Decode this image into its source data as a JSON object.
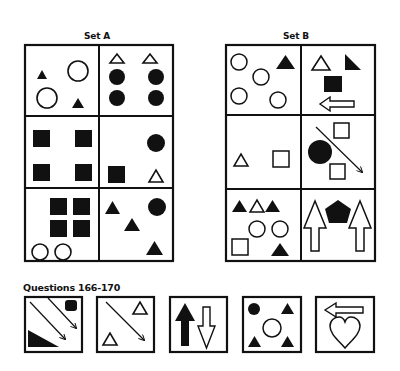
{
  "set_a": {
    "title": "Set A",
    "cells": [
      {
        "row": 1,
        "col": 1,
        "shapes": [
          "black triangle",
          "white circle",
          "white circle",
          "black triangle"
        ]
      },
      {
        "row": 1,
        "col": 2,
        "shapes": [
          "white triangle",
          "white triangle",
          "black circle",
          "black circle",
          "black circle",
          "black circle"
        ]
      },
      {
        "row": 2,
        "col": 1,
        "shapes": [
          "black square",
          "black square",
          "black square",
          "black square"
        ]
      },
      {
        "row": 2,
        "col": 2,
        "shapes": [
          "black circle",
          "black square",
          "white triangle"
        ]
      },
      {
        "row": 3,
        "col": 1,
        "shapes": [
          "black square",
          "black square",
          "black square",
          "black square",
          "white circle",
          "white circle"
        ]
      },
      {
        "row": 3,
        "col": 2,
        "shapes": [
          "black triangle",
          "black circle",
          "black triangle",
          "black triangle"
        ]
      }
    ]
  },
  "set_b": {
    "title": "Set B",
    "cells": [
      {
        "row": 1,
        "col": 1,
        "shapes": [
          "white circle",
          "black triangle",
          "white circle",
          "white circle",
          "white circle"
        ]
      },
      {
        "row": 1,
        "col": 2,
        "shapes": [
          "white triangle",
          "black right triangle",
          "black square",
          "white left arrow"
        ]
      },
      {
        "row": 2,
        "col": 1,
        "shapes": [
          "white triangle",
          "white square"
        ]
      },
      {
        "row": 2,
        "col": 2,
        "shapes": [
          "white square",
          "black circle",
          "white square",
          "diagonal arrow"
        ]
      },
      {
        "row": 3,
        "col": 1,
        "shapes": [
          "black triangle",
          "white triangle",
          "black triangle",
          "white circle",
          "white circle",
          "white square",
          "black triangle"
        ]
      },
      {
        "row": 3,
        "col": 2,
        "shapes": [
          "white up arrow",
          "black pentagon",
          "white up arrow"
        ]
      }
    ]
  },
  "questions": {
    "title": "Questions 166-170",
    "items": [
      {
        "number": 166,
        "shapes": [
          "diagonal arrow",
          "diagonal arrow",
          "black rounded square",
          "black right triangle"
        ]
      },
      {
        "number": 167,
        "shapes": [
          "diagonal arrow",
          "white triangle",
          "white triangle"
        ]
      },
      {
        "number": 168,
        "shapes": [
          "black up arrow",
          "white down arrow"
        ]
      },
      {
        "number": 169,
        "shapes": [
          "black circle",
          "black triangle",
          "white circle",
          "black triangle",
          "black triangle"
        ]
      },
      {
        "number": 170,
        "shapes": [
          "white left arrow",
          "white heart"
        ]
      }
    ]
  },
  "colors": {
    "ink": "#111111",
    "background": "#ffffff"
  }
}
